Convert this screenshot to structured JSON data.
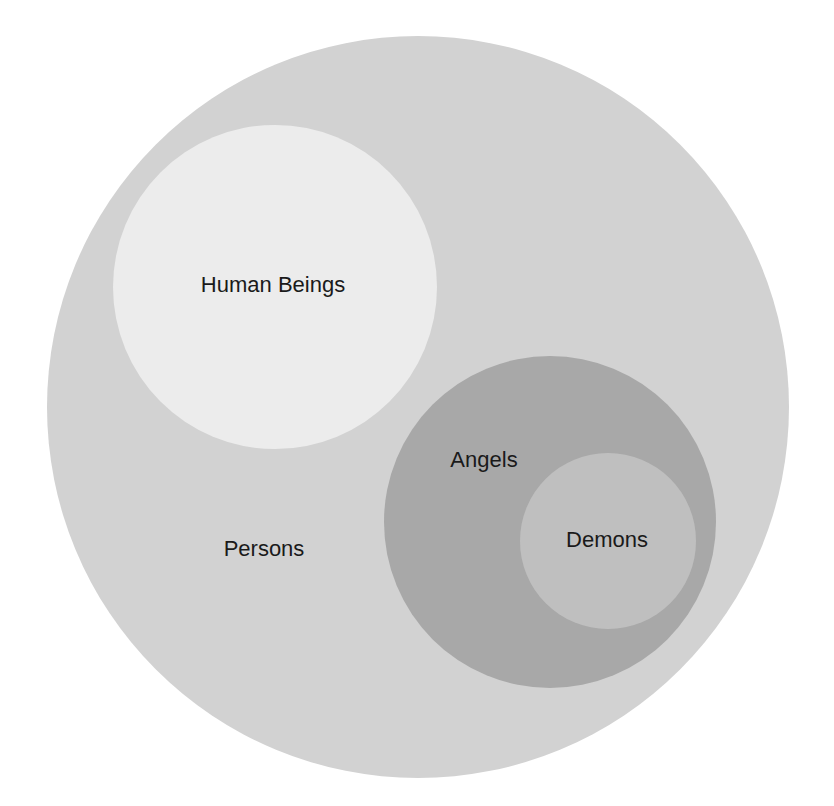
{
  "diagram": {
    "type": "euler",
    "sets": [
      {
        "id": "persons",
        "label": "Persons",
        "color": "#d2d2d2",
        "cx": 418,
        "cy": 407,
        "r": 371,
        "label_x": 264,
        "label_y": 549,
        "contains": [
          "human_beings",
          "angels"
        ]
      },
      {
        "id": "human_beings",
        "label": "Human Beings",
        "color": "#ececec",
        "cx": 275,
        "cy": 287,
        "r": 162,
        "label_x": 273,
        "label_y": 285,
        "contains": []
      },
      {
        "id": "angels",
        "label": "Angels",
        "color": "#a8a8a8",
        "cx": 550,
        "cy": 522,
        "r": 166,
        "label_x": 484,
        "label_y": 460,
        "contains": [
          "demons"
        ]
      },
      {
        "id": "demons",
        "label": "Demons",
        "color": "#bfbfbf",
        "cx": 608,
        "cy": 541,
        "r": 88,
        "label_x": 607,
        "label_y": 540,
        "contains": []
      }
    ]
  },
  "labels": {
    "persons": "Persons",
    "human_beings": "Human Beings",
    "angels": "Angels",
    "demons": "Demons"
  }
}
